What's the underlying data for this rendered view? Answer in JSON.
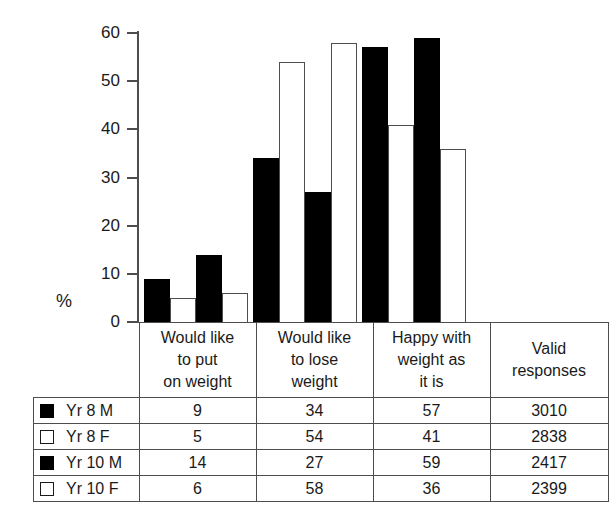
{
  "chart_data": {
    "type": "bar",
    "title": "",
    "subtitle": "",
    "xlabel": "",
    "ylabel": "%",
    "ylim": [
      0,
      60
    ],
    "ytick_labels": [
      "60",
      "50",
      "40",
      "30",
      "20",
      "10",
      "0"
    ],
    "ytick_values": [
      60,
      50,
      40,
      30,
      20,
      10,
      0
    ],
    "grid": false,
    "legend_position": "table-left-column",
    "categories": [
      "Would like to put on weight",
      "Would like to lose weight",
      "Happy with weight as it is"
    ],
    "series": [
      {
        "name": "Yr 8 M",
        "style": "filled",
        "color": "#000000",
        "values": [
          9,
          34,
          57
        ],
        "valid_responses": 3010
      },
      {
        "name": "Yr 8 F",
        "style": "hollow",
        "color": "#ffffff",
        "values": [
          5,
          54,
          41
        ],
        "valid_responses": 2838
      },
      {
        "name": "Yr 10 M",
        "style": "filled",
        "color": "#000000",
        "values": [
          14,
          27,
          59
        ],
        "valid_responses": 2417
      },
      {
        "name": "Yr 10 F",
        "style": "hollow",
        "color": "#ffffff",
        "values": [
          6,
          58,
          36
        ],
        "valid_responses": 2399
      }
    ]
  },
  "axis": {
    "unit_label": "%",
    "ticks": [
      {
        "label": "60",
        "value": 60
      },
      {
        "label": "50",
        "value": 50
      },
      {
        "label": "40",
        "value": 40
      },
      {
        "label": "30",
        "value": 30
      },
      {
        "label": "20",
        "value": 20
      },
      {
        "label": "10",
        "value": 10
      },
      {
        "label": "0",
        "value": 0
      }
    ]
  },
  "table": {
    "headers": [
      {
        "id": "legend",
        "lines": []
      },
      {
        "id": "put-on-weight",
        "lines": [
          "Would like",
          "to put",
          "on weight"
        ]
      },
      {
        "id": "lose-weight",
        "lines": [
          "Would like",
          "to lose",
          "weight"
        ]
      },
      {
        "id": "happy-with-weight",
        "lines": [
          "Happy with",
          "weight as",
          "it is"
        ]
      },
      {
        "id": "valid-responses",
        "lines": [
          "Valid",
          "responses"
        ]
      }
    ],
    "rows": [
      {
        "swatch": "filled",
        "label": "Yr 8 M",
        "cells": [
          "9",
          "34",
          "57",
          "3010"
        ]
      },
      {
        "swatch": "hollow",
        "label": "Yr 8 F",
        "cells": [
          "5",
          "54",
          "41",
          "2838"
        ]
      },
      {
        "swatch": "filled",
        "label": "Yr 10 M",
        "cells": [
          "14",
          "27",
          "59",
          "2417"
        ]
      },
      {
        "swatch": "hollow",
        "label": "Yr 10 F",
        "cells": [
          "6",
          "58",
          "36",
          "2399"
        ]
      }
    ]
  },
  "colors": {
    "filled_bar": "#000000",
    "hollow_bar_outline": "#4d4d4d",
    "axis": "#4d4d4d",
    "table_border": "#4d4d4d",
    "text": "#1a1a1a",
    "background": "#ffffff"
  }
}
